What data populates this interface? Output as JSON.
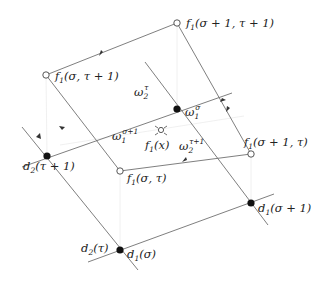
{
  "diagram": {
    "type": "geometric lattice diagram",
    "colors": {
      "line": "#666666",
      "faint_line": "#e6e6e6",
      "point": "#111111",
      "background": "#ffffff"
    },
    "points": [
      {
        "id": "f1_s1_t1",
        "kind": "open",
        "x": 177,
        "y": 23,
        "label": {
          "f": "f",
          "sub": "1",
          "args": "(σ + 1, τ + 1)",
          "x": 186,
          "y": 27
        }
      },
      {
        "id": "f1_s_t1",
        "kind": "open",
        "x": 46,
        "y": 75,
        "label": {
          "f": "f",
          "sub": "1",
          "args": "(σ, τ + 1)",
          "x": 55,
          "y": 80
        }
      },
      {
        "id": "f1_s1_t",
        "kind": "open",
        "x": 251,
        "y": 154,
        "label": {
          "f": "f",
          "sub": "1",
          "args": "(σ + 1, τ)",
          "x": 244,
          "y": 146
        }
      },
      {
        "id": "f1_s_t",
        "kind": "open",
        "x": 120,
        "y": 171,
        "label": {
          "f": "f",
          "sub": "1",
          "args": "(σ, τ)",
          "x": 127,
          "y": 182
        }
      },
      {
        "id": "f1_x",
        "kind": "open-small",
        "x": 161,
        "y": 130,
        "label": {
          "f": "f",
          "sub": "1",
          "args": "(x)",
          "x": 145,
          "y": 149
        }
      },
      {
        "id": "omega1_sigma",
        "kind": "filled",
        "x": 177,
        "y": 109
      },
      {
        "id": "d2_t1",
        "kind": "filled",
        "x": 47,
        "y": 156,
        "label": {
          "f": "d",
          "sub": "2",
          "args": "(τ + 1)",
          "x": 23,
          "y": 170
        }
      },
      {
        "id": "d1_s",
        "kind": "filled",
        "x": 120,
        "y": 250,
        "label": {
          "f": "d",
          "sub": "1",
          "args": "(σ)",
          "x": 127,
          "y": 258
        }
      },
      {
        "id": "d2_t",
        "kind": "text-only",
        "label": {
          "f": "d",
          "sub": "2",
          "args": "(τ)",
          "x": 81,
          "y": 252
        }
      },
      {
        "id": "d1_s1",
        "kind": "filled",
        "x": 251,
        "y": 203,
        "label": {
          "f": "d",
          "sub": "1",
          "args": "(σ + 1)",
          "x": 258,
          "y": 212
        }
      }
    ],
    "omega_labels": [
      {
        "base": "ω",
        "sub": "2",
        "sup": "τ",
        "x": 134,
        "y": 96
      },
      {
        "base": "ω",
        "sub": "1",
        "sup": "σ",
        "x": 185,
        "y": 116
      },
      {
        "base": "ω",
        "sub": "1",
        "sup": "σ+1",
        "x": 112,
        "y": 140
      },
      {
        "base": "ω",
        "sub": "2",
        "sup": "τ+1",
        "x": 179,
        "y": 150
      }
    ]
  }
}
